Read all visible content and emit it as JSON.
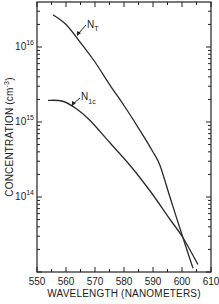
{
  "chart_data": {
    "type": "line",
    "title": "",
    "xlabel": "WAVELENGTH (NANOMETERS)",
    "ylabel": "CONCENTRATION (cm⁻³)",
    "ylabel_base": "CONCENTRATION (cm",
    "ylabel_exp": "-3",
    "ylabel_close": ")",
    "xlim": [
      550,
      610
    ],
    "ylim_log10": [
      13,
      16.6
    ],
    "yscale": "log",
    "grid": false,
    "x_ticks": [
      "550",
      "560",
      "570",
      "580",
      "590",
      "600",
      "610"
    ],
    "y_ticks": [
      {
        "base": "10",
        "exp": "16",
        "log10": 16
      },
      {
        "base": "10",
        "exp": "15",
        "log10": 15
      },
      {
        "base": "10",
        "exp": "14",
        "log10": 14
      }
    ],
    "series": [
      {
        "name": "N_T",
        "label_main": "N",
        "label_sub": "T",
        "x": [
          555.5,
          560.0,
          564.8,
          570.0,
          575.2,
          580.0,
          585.5,
          590.0,
          592.4,
          596.0,
          600.3,
          603.8
        ],
        "log10_y": [
          16.43,
          16.3,
          16.07,
          15.8,
          15.49,
          15.22,
          14.89,
          14.6,
          14.42,
          13.98,
          13.46,
          13.05
        ]
      },
      {
        "name": "N_1c",
        "label_main": "N",
        "label_sub": "1c",
        "x": [
          553.8,
          558.6,
          563.1,
          568.3,
          575.2,
          582.1,
          589.0,
          595.9,
          600.3,
          605.5
        ],
        "log10_y": [
          15.29,
          15.28,
          15.19,
          15.02,
          14.72,
          14.42,
          14.08,
          13.7,
          13.46,
          13.1
        ]
      }
    ]
  }
}
